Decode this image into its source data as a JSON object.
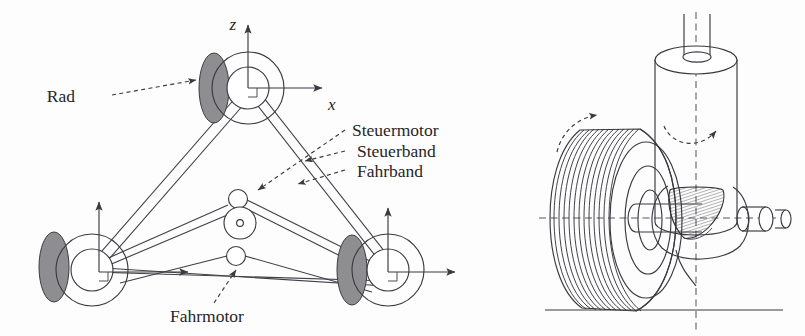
{
  "figure": {
    "title_visible": false,
    "background_color": "#fdfdfd",
    "ink_color": "#3a3a40",
    "wheel_shade_color": "#8e8e90",
    "panels": [
      {
        "id": "left-schematic",
        "name": "three-wheel-drive-schematic"
      },
      {
        "id": "right-detail",
        "name": "steered-wheel-3d-detail"
      }
    ]
  },
  "labels": {
    "rad": "Rad",
    "steuermotor": "Steuermotor",
    "steuerband": "Steuerband",
    "fahrband": "Fahrband",
    "fahrmotor": "Fahrmotor"
  },
  "axes": {
    "z": "z",
    "x": "x",
    "x_bottom": "x"
  },
  "left_panel": {
    "wheel_assemblies": [
      {
        "name": "top-wheel",
        "cx": 244,
        "cy": 88,
        "has_axes": true
      },
      {
        "name": "bottom-left-wheel",
        "cx": 88,
        "cy": 267,
        "has_axes": true
      },
      {
        "name": "bottom-right-wheel",
        "cx": 383,
        "cy": 267,
        "has_axes": true
      }
    ],
    "center_pulleys": [
      {
        "name": "steuermotor-pulley",
        "cx": 238,
        "cy": 198,
        "r": 9
      },
      {
        "name": "mid-pulley",
        "cx": 240,
        "cy": 222,
        "r": 16
      },
      {
        "name": "fahrmotor-pulley",
        "cx": 236,
        "cy": 255,
        "r": 9
      }
    ],
    "belt_count": 2,
    "belt_names": [
      "Steuerband",
      "Fahrband"
    ]
  },
  "right_panel": {
    "parts": [
      {
        "name": "tread-wheel",
        "tread_grooves": 12
      },
      {
        "name": "steering-column-cylinder"
      },
      {
        "name": "bevel-gear"
      },
      {
        "name": "wheel-axle"
      },
      {
        "name": "ground-line"
      }
    ],
    "rotation_arrows": [
      {
        "name": "wheel-rotation-arrow",
        "axis": "wheel-spin"
      },
      {
        "name": "steering-rotation-arrow",
        "axis": "vertical-steering"
      }
    ],
    "center_lines": [
      "vertical-steering-axis",
      "horizontal-axle-axis"
    ]
  }
}
